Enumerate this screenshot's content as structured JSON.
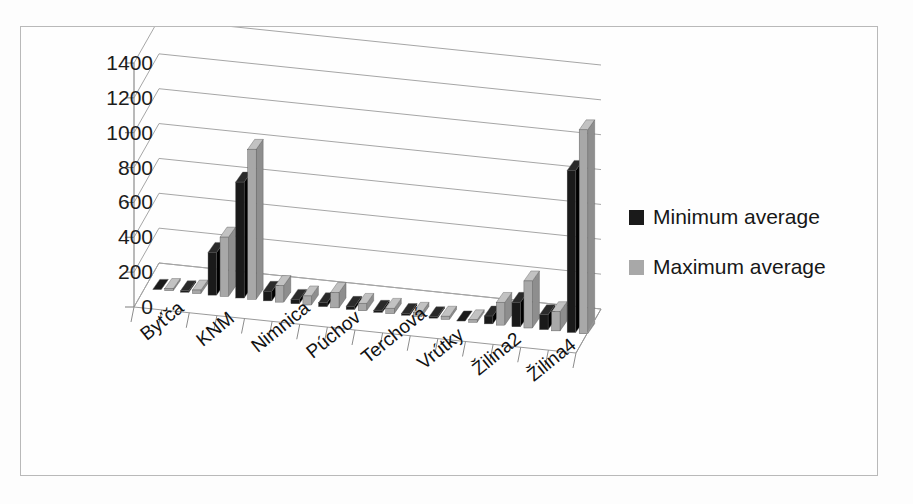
{
  "chart_data": {
    "type": "bar",
    "title": "",
    "subtitle": "",
    "xlabel": "",
    "ylabel": "",
    "ylim": [
      0,
      1400
    ],
    "ytick_step": 200,
    "yticks": [
      "1400",
      "1200",
      "1000",
      "800",
      "600",
      "400",
      "200",
      "0"
    ],
    "grid": true,
    "three_d": true,
    "legend_position": "right",
    "categories": [
      "Byťča",
      "",
      "KNM",
      "",
      "Nimnica",
      "",
      "Púchov",
      "",
      "Terchová",
      "",
      "Vrútky",
      "",
      "Žilina2",
      "",
      "Žilina4",
      ""
    ],
    "visible_category_labels": [
      "Byťča",
      "KNM",
      "Nimnica",
      "Púchov",
      "Terchová",
      "Vrútky",
      "Žilina2",
      "Žilina4"
    ],
    "series": [
      {
        "name": "Minimum average",
        "color": "#1a1a1a",
        "values": [
          5,
          8,
          245,
          665,
          55,
          25,
          22,
          18,
          12,
          10,
          8,
          6,
          45,
          140,
          85,
          930
        ]
      },
      {
        "name": "Maximum average",
        "color": "#a8a8a8",
        "values": [
          12,
          20,
          340,
          860,
          95,
          52,
          88,
          42,
          30,
          24,
          18,
          14,
          130,
          270,
          110,
          1170
        ]
      }
    ]
  },
  "legend": {
    "items": [
      {
        "label": "Minimum average",
        "color": "#1a1a1a"
      },
      {
        "label": "Maximum average",
        "color": "#a8a8a8"
      }
    ]
  }
}
